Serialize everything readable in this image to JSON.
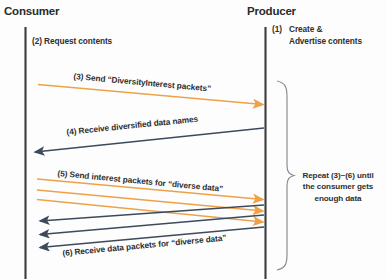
{
  "diagram": {
    "title_left": "Consumer",
    "title_right": "Producer",
    "colors": {
      "lifeline": "#3b3b3b",
      "orange_arrow": "#eda24a",
      "dark_arrow": "#3d4a5c",
      "brace": "#8a8a8a",
      "text": "#2f2f2f",
      "background": "#fdfdfd"
    },
    "lanes": [
      {
        "name": "consumer",
        "label": "Consumer"
      },
      {
        "name": "producer",
        "label": "Producer"
      }
    ],
    "notes": [
      {
        "id": "note-1",
        "number": "(1)",
        "line1": "Create &",
        "line2": "Advertise contents",
        "lane": "producer"
      },
      {
        "id": "note-2",
        "text": "(2) Request contents",
        "lane": "consumer"
      }
    ],
    "messages": [
      {
        "id": "msg-3",
        "label": "(3) Send “DiversityInterest packets”",
        "direction": "consumer-to-producer",
        "color": "orange",
        "count": 1
      },
      {
        "id": "msg-4",
        "label": "(4) Receive diversified data names",
        "direction": "producer-to-consumer",
        "color": "dark",
        "count": 1
      },
      {
        "id": "msg-5",
        "label": "(5) Send interest packets for “diverse data”",
        "direction": "consumer-to-producer",
        "color": "orange",
        "count": 3
      },
      {
        "id": "msg-6",
        "label": "(6) Receive data packets for “diverse data”",
        "direction": "producer-to-consumer",
        "color": "dark",
        "count": 3
      }
    ],
    "repeat_brace": {
      "line1": "Repeat (3)~(6) until",
      "line2": "the consumer gets",
      "line3": "enough data"
    }
  }
}
